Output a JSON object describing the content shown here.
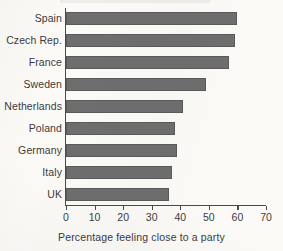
{
  "chart_data": {
    "type": "bar",
    "orientation": "horizontal",
    "title": "",
    "subtitle": "",
    "xlabel": "Percentage feeling close to a party",
    "ylabel": "",
    "categories": [
      "Spain",
      "Czech Rep.",
      "France",
      "Sweden",
      "Netherlands",
      "Poland",
      "Germany",
      "Italy",
      "UK"
    ],
    "values": [
      60,
      59,
      57,
      49,
      41,
      38,
      39,
      37,
      36
    ],
    "xlim": [
      0,
      70
    ],
    "xticks": [
      0,
      10,
      20,
      30,
      40,
      50,
      60,
      70
    ],
    "xtick_labels": [
      "0",
      "10",
      "20",
      "30",
      "40",
      "50",
      "60",
      "70"
    ],
    "grid": false,
    "legend": false,
    "bar_color": "#6e6e6e",
    "bar_edge_color": "#5a5a5a",
    "axis_color": "#4a4a4a",
    "text_color": "#3b3b3b",
    "background_color": "#fbfaf7"
  }
}
